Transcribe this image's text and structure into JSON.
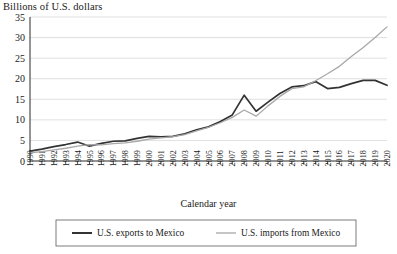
{
  "chart_data": {
    "type": "line",
    "title": "",
    "ylabel": "Billions of U.S. dollars",
    "xlabel": "Calendar year",
    "ylim": [
      0,
      35
    ],
    "yticks": [
      0,
      5,
      10,
      15,
      20,
      25,
      30,
      35
    ],
    "grid": true,
    "legend_position": "bottom",
    "x": [
      1990,
      1991,
      1992,
      1993,
      1994,
      1995,
      1996,
      1997,
      1998,
      1999,
      2000,
      2001,
      2002,
      2003,
      2004,
      2005,
      2006,
      2007,
      2008,
      2009,
      2010,
      2011,
      2012,
      2013,
      2014,
      2015,
      2016,
      2017,
      2018,
      2019,
      2020
    ],
    "categories": [
      "1990",
      "1991",
      "1992",
      "1993",
      "1994",
      "1995",
      "1996",
      "1997",
      "1998",
      "1999",
      "2000",
      "2001",
      "2002",
      "2003",
      "2004",
      "2005",
      "2006",
      "2007",
      "2008",
      "2009",
      "2010",
      "2011",
      "2012",
      "2013",
      "2014",
      "2015",
      "2016",
      "2017",
      "2018",
      "2019",
      "2020"
    ],
    "series": [
      {
        "name": "U.S. exports to Mexico",
        "color": "#333333",
        "values": [
          2.4,
          2.9,
          3.5,
          4.0,
          4.6,
          3.6,
          4.3,
          4.8,
          4.9,
          5.5,
          6.0,
          5.9,
          6.0,
          6.6,
          7.6,
          8.3,
          9.6,
          11.2,
          16.0,
          12.1,
          14.3,
          16.4,
          18.0,
          18.3,
          19.3,
          17.6,
          17.9,
          18.8,
          19.6,
          19.6,
          18.4
        ]
      },
      {
        "name": "U.S. imports from Mexico",
        "color": "#a8a8a8",
        "values": [
          2.0,
          2.3,
          2.7,
          3.1,
          3.6,
          4.0,
          3.9,
          4.2,
          4.4,
          4.8,
          5.3,
          5.6,
          5.9,
          6.4,
          7.3,
          8.2,
          9.3,
          10.6,
          12.4,
          10.9,
          13.4,
          15.7,
          17.6,
          18.0,
          19.5,
          21.2,
          23.0,
          25.4,
          27.6,
          30.0,
          32.6
        ]
      }
    ],
    "legend": [
      {
        "label": "U.S. exports to Mexico",
        "color": "#333333",
        "line_weight": "thick"
      },
      {
        "label": "U.S. imports from Mexico",
        "color": "#a8a8a8",
        "line_weight": "thin"
      }
    ]
  }
}
